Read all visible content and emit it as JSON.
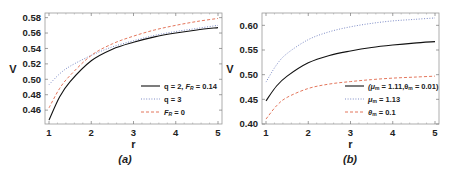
{
  "chart_data": [
    {
      "type": "line",
      "panel": "(a)",
      "caption_letter": "a",
      "xlabel": "r",
      "ylabel": "V",
      "xlim": [
        1,
        5
      ],
      "ylim": [
        0.442,
        0.586
      ],
      "xticks": [
        "1",
        "2",
        "3",
        "4",
        "5"
      ],
      "yticks": [
        "0.46",
        "0.48",
        "0.50",
        "0.52",
        "0.54",
        "0.56",
        "0.58"
      ],
      "grid": false,
      "legend_position": "lower right",
      "x": [
        1,
        1.25,
        1.5,
        2,
        2.5,
        3,
        3.5,
        4,
        4.5,
        5
      ],
      "series": [
        {
          "name": "q = 2, F_R = 0.14",
          "label_main": "q = 2, ",
          "label_italic": "F",
          "label_sub": "R",
          "label_tail": " = 0.14",
          "style": "solid",
          "color": "#111111",
          "values": [
            0.447,
            0.477,
            0.497,
            0.524,
            0.539,
            0.548,
            0.555,
            0.56,
            0.564,
            0.567
          ]
        },
        {
          "name": "q = 3",
          "label_main": "q = 3",
          "style": "dotted",
          "color": "#6f7fc0",
          "values": [
            0.493,
            0.507,
            0.517,
            0.531,
            0.542,
            0.55,
            0.557,
            0.562,
            0.566,
            0.57
          ]
        },
        {
          "name": "F_R = 0",
          "label_italic": "F",
          "label_sub": "R",
          "label_tail": " = 0",
          "style": "dashed",
          "color": "#e0674a",
          "values": [
            0.463,
            0.488,
            0.505,
            0.531,
            0.546,
            0.556,
            0.564,
            0.57,
            0.575,
            0.579
          ]
        }
      ]
    },
    {
      "type": "line",
      "panel": "(b)",
      "caption_letter": "b",
      "xlabel": "r",
      "ylabel": "V",
      "xlim": [
        1,
        5
      ],
      "ylim": [
        0.4,
        0.625
      ],
      "xticks": [
        "1",
        "2",
        "3",
        "4",
        "5"
      ],
      "yticks": [
        "0.40",
        "0.45",
        "0.50",
        "0.55",
        "0.60"
      ],
      "grid": false,
      "legend_position": "lower right",
      "x": [
        1,
        1.25,
        1.5,
        2,
        2.5,
        3,
        3.5,
        4,
        4.5,
        5
      ],
      "series": [
        {
          "name": "(μ_m = 1.11, θ_m = 0.01)",
          "label_text": "(μ",
          "label_sub": "m",
          "label_mid": " = 1.11,θ",
          "label_sub2": "m",
          "label_tail": " = 0.01)",
          "style": "solid",
          "color": "#111111",
          "values": [
            0.447,
            0.477,
            0.497,
            0.524,
            0.539,
            0.548,
            0.555,
            0.56,
            0.564,
            0.567
          ]
        },
        {
          "name": "μ_m = 1.13",
          "label_text": "μ",
          "label_sub": "m",
          "label_tail": " = 1.13",
          "style": "dotted",
          "color": "#6f7fc0",
          "values": [
            0.485,
            0.52,
            0.543,
            0.571,
            0.587,
            0.597,
            0.604,
            0.609,
            0.612,
            0.615
          ]
        },
        {
          "name": "θ_m = 0.1",
          "label_text": "θ",
          "label_sub": "m",
          "label_tail": " = 0.1",
          "style": "dashed",
          "color": "#e0674a",
          "values": [
            0.41,
            0.437,
            0.454,
            0.472,
            0.481,
            0.486,
            0.49,
            0.493,
            0.495,
            0.497
          ]
        }
      ]
    }
  ],
  "panels": {
    "a": {
      "caption": "(a)",
      "xlabel": "r",
      "ylabel": "V",
      "legend": [
        "q = 2, F_R = 0.14",
        "q = 3",
        "F_R = 0"
      ]
    },
    "b": {
      "caption": "(b)",
      "xlabel": "r",
      "ylabel": "V",
      "legend": [
        "(μ_m = 1.11,θ_m = 0.01)",
        "μ_m = 1.13",
        "θ_m = 0.1"
      ]
    }
  }
}
